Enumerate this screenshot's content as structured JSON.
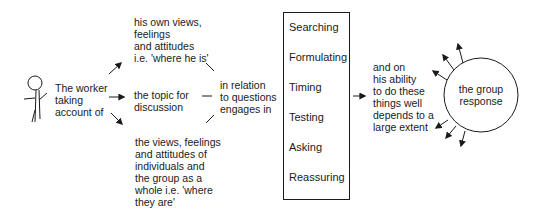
{
  "actor": {
    "label": "The worker taking account of",
    "lines": [
      "The worker",
      "taking",
      "account of"
    ]
  },
  "considerations": [
    {
      "lines": [
        "his own views,",
        "feelings",
        "and attitudes",
        "i.e. 'where he is'"
      ]
    },
    {
      "lines": [
        "the topic for",
        "discussion"
      ]
    },
    {
      "lines": [
        "the views, feelings",
        "and attitudes of",
        "individuals and",
        "the group as a",
        "whole i.e. 'where",
        "they are'"
      ]
    }
  ],
  "relation": {
    "lines": [
      "in relation",
      "to questions",
      "engages in"
    ]
  },
  "skills": [
    "Searching",
    "Formulating",
    "Timing",
    "Testing",
    "Asking",
    "Reassuring"
  ],
  "dependency": {
    "lines": [
      "and on",
      "his ability",
      "to do these",
      "things well",
      "depends to a",
      "large extent"
    ]
  },
  "outcome": {
    "lines": [
      "the group",
      "response"
    ]
  }
}
